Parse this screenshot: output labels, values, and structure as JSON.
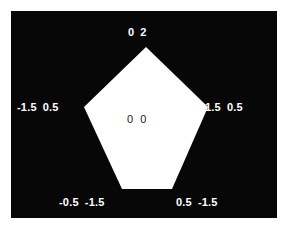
{
  "figure": {
    "width": 287,
    "height": 230,
    "background_color": "#ffffff",
    "plot_background_color": "#070707",
    "polygon_fill_color": "#ffffff",
    "vertex_label_color": "#ffffff",
    "center_label_color": "#1a1a1a"
  },
  "chart_data": {
    "type": "scatter",
    "title": "",
    "xlabel": "",
    "ylabel": "",
    "xlim": [
      -2,
      2
    ],
    "ylim": [
      -2,
      2
    ],
    "grid": false,
    "legend": null,
    "shape": "pentagon",
    "annotations": [
      {
        "name": "top",
        "x": "0",
        "y": "2"
      },
      {
        "name": "left",
        "x": "-1.5",
        "y": "0.5"
      },
      {
        "name": "right",
        "x": "1.5",
        "y": "0.5"
      },
      {
        "name": "bottom-left",
        "x": "-0.5",
        "y": "-1.5"
      },
      {
        "name": "bottom-right",
        "x": "0.5",
        "y": "-1.5"
      },
      {
        "name": "center",
        "x": "0",
        "y": "0"
      }
    ],
    "points": [
      {
        "label": "0 2",
        "x": 0,
        "y": 2
      },
      {
        "label": "-1.5 0.5",
        "x": -1.5,
        "y": 0.5
      },
      {
        "label": "1.5 0.5",
        "x": 1.5,
        "y": 0.5
      },
      {
        "label": "-0.5 -1.5",
        "x": -0.5,
        "y": -1.5
      },
      {
        "label": "0.5 -1.5",
        "x": 0.5,
        "y": -1.5
      },
      {
        "label": "0 0",
        "x": 0,
        "y": 0
      }
    ],
    "polygon_pixel_vertices": "135,36 73,96 111,178 161,178 197,96"
  }
}
